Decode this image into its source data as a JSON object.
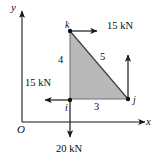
{
  "figure": {
    "type": "free-body-diagram",
    "background_color": "#ffffff",
    "plate_fill_color": "#b9b9b9",
    "plate_edge_color": "#5a5a5a",
    "line_color": "#1a1a1a"
  },
  "axes": {
    "x_label": "x",
    "y_label": "y",
    "origin_label": "O"
  },
  "nodes": [
    {
      "id": "i",
      "label": "i",
      "x": 70,
      "y": 100
    },
    {
      "id": "j",
      "label": "j",
      "x": 128,
      "y": 99
    },
    {
      "id": "k",
      "label": "k",
      "x": 70,
      "y": 31
    }
  ],
  "side_lengths": [
    {
      "name": "vertical-side-ik",
      "label": "4"
    },
    {
      "name": "hypotenuse-kj",
      "label": "5"
    },
    {
      "name": "horizontal-side-ij",
      "label": "3"
    }
  ],
  "forces": [
    {
      "name": "force-at-k",
      "label": "15 kN",
      "at_node": "k",
      "direction": "right",
      "magnitude": 15,
      "unit": "kN"
    },
    {
      "name": "force-at-i-horizontal",
      "label": "15 kN",
      "at_node": "i",
      "direction": "left",
      "magnitude": 15,
      "unit": "kN"
    },
    {
      "name": "force-at-i-vertical",
      "label": "20 kN",
      "at_node": "i",
      "direction": "down",
      "magnitude": 20,
      "unit": "kN"
    },
    {
      "name": "force-at-j-vertical",
      "label": "",
      "at_node": "j",
      "direction": "up",
      "magnitude": null,
      "unit": ""
    }
  ]
}
